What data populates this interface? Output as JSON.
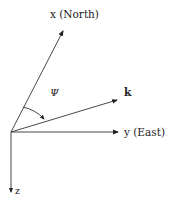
{
  "diagram": {
    "title": "",
    "colors": {
      "line": "#333333",
      "text": "#222222",
      "background": "#ffffff"
    },
    "axes": {
      "x": {
        "label": "x (North)"
      },
      "y": {
        "label": "y (East)"
      },
      "z": {
        "label": "z"
      }
    },
    "vectors": {
      "k": {
        "label": "k"
      }
    },
    "angle": {
      "label": "Ψ"
    }
  }
}
